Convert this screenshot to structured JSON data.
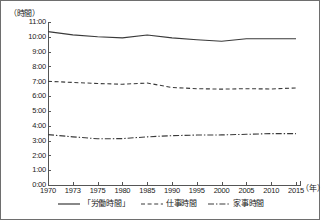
{
  "chart_data": {
    "type": "line",
    "title": "",
    "ylabel": "（時間）",
    "xlabel": "（年）",
    "grid": false,
    "legend_position": "bottom-center",
    "x": [
      1970,
      1973,
      1975,
      1980,
      1985,
      1990,
      1995,
      2000,
      2005,
      2010,
      2015
    ],
    "xtick_labels": [
      "1970",
      "1973",
      "1975",
      "1980",
      "1985",
      "1990",
      "1995",
      "2000",
      "2005",
      "2010",
      "2015"
    ],
    "ylim": [
      0,
      11
    ],
    "ytick_labels": [
      "11:00",
      "10:00",
      "9:00",
      "8:00",
      "7:00",
      "6:00",
      "5:00",
      "4:00",
      "3:00",
      "2:00",
      "1:00",
      "0:00"
    ],
    "ytick_values": [
      11,
      10,
      9,
      8,
      7,
      6,
      5,
      4,
      3,
      2,
      1,
      0
    ],
    "series": [
      {
        "name": "「労働時間」",
        "style": "solid",
        "color": "#3a3a3a",
        "values": [
          10.35,
          10.13,
          10.0,
          9.93,
          10.12,
          9.93,
          9.8,
          9.7,
          9.87,
          9.87,
          9.87
        ]
      },
      {
        "name": "仕事時間",
        "style": "dashed",
        "color": "#3a3a3a",
        "values": [
          7.0,
          6.92,
          6.85,
          6.8,
          6.88,
          6.58,
          6.5,
          6.47,
          6.5,
          6.48,
          6.55
        ]
      },
      {
        "name": "家事時間",
        "style": "dashdot",
        "color": "#3a3a3a",
        "values": [
          3.4,
          3.25,
          3.12,
          3.13,
          3.25,
          3.33,
          3.37,
          3.38,
          3.42,
          3.47,
          3.47
        ]
      }
    ]
  },
  "legend": {
    "items": [
      {
        "label": "「労働時間」",
        "style": "solid"
      },
      {
        "label": "仕事時間",
        "style": "dashed"
      },
      {
        "label": "家事時間",
        "style": "dashdot"
      }
    ]
  },
  "colors": {
    "line": "#3a3a3a",
    "axis": "#555555",
    "border": "#6e6e6e",
    "text": "#1a1a1a"
  }
}
